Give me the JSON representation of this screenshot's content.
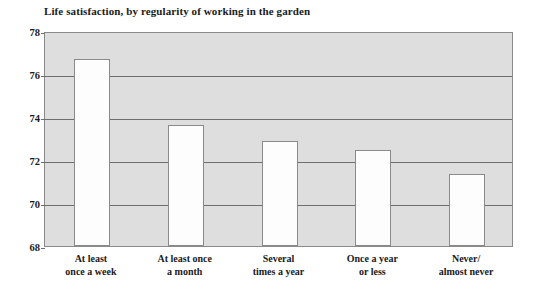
{
  "chart_data": {
    "type": "bar",
    "title": "Life satisfaction, by regularity of working in the garden",
    "xlabel": "",
    "ylabel": "",
    "categories": [
      "At least once a week",
      "At least once a month",
      "Several times a year",
      "Once a year or less",
      "Never/ almost never"
    ],
    "category_lines": [
      [
        "At least",
        "once a week"
      ],
      [
        "At least once",
        "a month"
      ],
      [
        "Several",
        "times a year"
      ],
      [
        "Once a year",
        "or less"
      ],
      [
        "Never/",
        "almost never"
      ]
    ],
    "values": [
      76.7,
      73.65,
      72.9,
      72.45,
      71.35
    ],
    "ylim": [
      68,
      78
    ],
    "yticks": [
      68,
      70,
      72,
      74,
      76,
      78
    ],
    "ytick_labels": [
      "68",
      "70",
      "72",
      "74",
      "76",
      "78"
    ],
    "grid": true,
    "legend": false,
    "colors": {
      "plot_background": "#dedede",
      "bar_fill": "#fdfdfd",
      "bar_border": "#8a8a8a",
      "gridline": "#6e6e6e",
      "text": "#1a1a1a",
      "page_background": "#ffffff"
    }
  }
}
